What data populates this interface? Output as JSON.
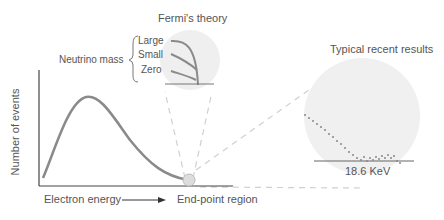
{
  "title_left": "Fermi's theory",
  "title_right": "Typical recent results",
  "neutrino": {
    "label": "Neutrino mass",
    "options": [
      "Large",
      "Small",
      "Zero"
    ]
  },
  "axes": {
    "ylabel": "Number of events",
    "xlabel": "Electron energy",
    "endpoint_label": "End-point region"
  },
  "result_value": "18.6 KeV",
  "colors": {
    "curve": "#8a8a8a",
    "axis": "#444444",
    "bubble": "#eeeeee",
    "dashes": "#cccccc"
  }
}
